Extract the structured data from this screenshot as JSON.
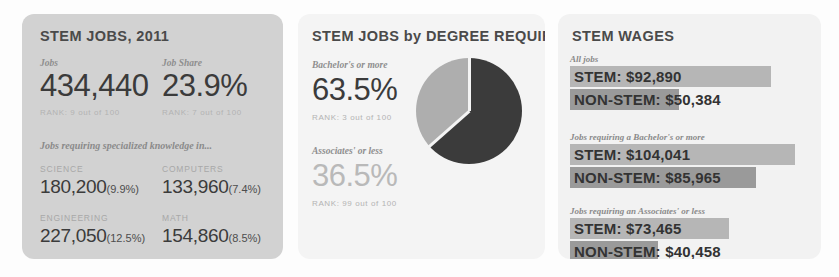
{
  "cards": {
    "jobs": {
      "title": "STEM JOBS, 2011",
      "stats": [
        {
          "label": "Jobs",
          "value": "434,440",
          "rank": "RANK: 9 out of 100"
        },
        {
          "label": "Job Share",
          "value": "23.9%",
          "rank": "RANK: 7 out of 100"
        }
      ],
      "breakdown_label": "Jobs requiring specialized knowledge in...",
      "breakdown": [
        {
          "category": "SCIENCE",
          "value": "180,200",
          "pct": "(9.9%)"
        },
        {
          "category": "COMPUTERS",
          "value": "133,960",
          "pct": "(7.4%)"
        },
        {
          "category": "ENGINEERING",
          "value": "227,050",
          "pct": "(12.5%)"
        },
        {
          "category": "MATH",
          "value": "154,860",
          "pct": "(8.5%)"
        }
      ]
    },
    "degree": {
      "title": "STEM JOBS by DEGREE REQUIRED",
      "segments": [
        {
          "label": "Bachelor's or more",
          "value": "63.5%",
          "rank": "RANK: 3 out of 100"
        },
        {
          "label": "Associates' or less",
          "value": "36.5%",
          "rank": "RANK: 99 out of 100"
        }
      ]
    },
    "wages": {
      "title": "STEM WAGES",
      "groups": [
        {
          "label": "All jobs",
          "bars": [
            {
              "text": "STEM: $92,890",
              "value": 92890
            },
            {
              "text": "NON-STEM: $50,384",
              "value": 50384
            }
          ]
        },
        {
          "label": "Jobs requiring a Bachelor's or more",
          "bars": [
            {
              "text": "STEM: $104,041",
              "value": 104041
            },
            {
              "text": "NON-STEM: $85,965",
              "value": 85965
            }
          ]
        },
        {
          "label": "Jobs requiring an Associates' or less",
          "bars": [
            {
              "text": "STEM: $73,465",
              "value": 73465
            },
            {
              "text": "NON-STEM: $40,458",
              "value": 40458
            }
          ]
        }
      ]
    }
  },
  "chart_data": [
    {
      "type": "pie",
      "title": "STEM JOBS by DEGREE REQUIRED",
      "categories": [
        "Bachelor's or more",
        "Associates' or less"
      ],
      "values": [
        63.5,
        36.5
      ],
      "unit": "%",
      "colors": [
        "#3b3b3b",
        "#aeaeae"
      ],
      "legend": "inline-labels",
      "annotations": [
        "RANK: 3 out of 100",
        "RANK: 99 out of 100"
      ]
    },
    {
      "type": "bar",
      "title": "STEM WAGES",
      "orientation": "horizontal",
      "categories": [
        "All jobs / STEM",
        "All jobs / NON-STEM",
        "Bachelor's or more / STEM",
        "Bachelor's or more / NON-STEM",
        "Associates' or less / STEM",
        "Associates' or less / NON-STEM"
      ],
      "values": [
        92890,
        50384,
        104041,
        85965,
        73465,
        40458
      ],
      "ylabel": "Annual wage (USD)",
      "xlabel": "",
      "xlim": [
        0,
        110000
      ],
      "grid": false,
      "colors": [
        "#b6b6b6",
        "#9a9a9a"
      ]
    },
    {
      "type": "bar",
      "title": "STEM JOBS, 2011 — jobs requiring specialized knowledge in...",
      "categories": [
        "SCIENCE",
        "COMPUTERS",
        "ENGINEERING",
        "MATH"
      ],
      "values": [
        180200,
        133960,
        227050,
        154860
      ],
      "share_pct": [
        9.9,
        7.4,
        12.5,
        8.5
      ],
      "ylabel": "Jobs",
      "xlabel": "",
      "grid": false
    }
  ],
  "colors": {
    "card_jobs_bg": "#d2d2d2",
    "card_degree_bg": "#f4f4f4",
    "card_wages_bg": "#f2f2f2",
    "pie_dark": "#3b3b3b",
    "pie_light": "#aeaeae",
    "bar_stem": "#b6b6b6",
    "bar_nonstem": "#9a9a9a",
    "text_dark": "#3b3b3b",
    "text_muted": "#8e8e8e"
  }
}
